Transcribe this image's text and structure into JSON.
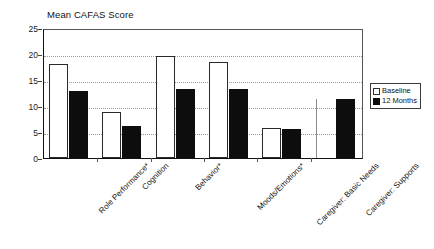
{
  "chart_data": {
    "type": "bar",
    "title": "Mean CAFAS Score",
    "xlabel": "",
    "ylabel": "",
    "ylim": [
      0,
      25
    ],
    "yticks": [
      0,
      5,
      10,
      15,
      20,
      25
    ],
    "grid": true,
    "legend_position": "right-outside",
    "categories": [
      "Role Performance*",
      "Cognition",
      "Behavior*",
      "Moods/Emotions*",
      "Caregiver: Basic Needs",
      "Caregiver: Supports"
    ],
    "series": [
      {
        "name": "Baseline",
        "color": "#ffffff",
        "values": [
          18.0,
          8.8,
          19.7,
          18.4,
          5.8,
          11.3
        ]
      },
      {
        "name": "12 Months",
        "color": "#0d0d0d",
        "values": [
          12.9,
          6.1,
          13.2,
          13.2,
          5.6,
          11.3
        ]
      }
    ]
  },
  "legend": {
    "entries": [
      {
        "label": "Baseline",
        "swatch": "open-square-swatch"
      },
      {
        "label": "12 Months",
        "swatch": "filled-square-swatch"
      }
    ]
  }
}
